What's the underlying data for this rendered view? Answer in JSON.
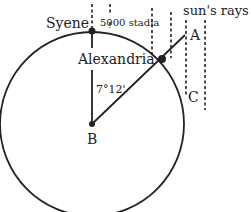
{
  "diagram": {
    "labels": {
      "syene": "Syene",
      "distance": "5000 stadia",
      "rays": "sun's rays",
      "alexandria": "Alexandria",
      "a": "A",
      "angle": "7°12'",
      "c": "C",
      "b": "B"
    },
    "colors": {
      "stroke": "#222222",
      "background": "#ffffff"
    }
  }
}
